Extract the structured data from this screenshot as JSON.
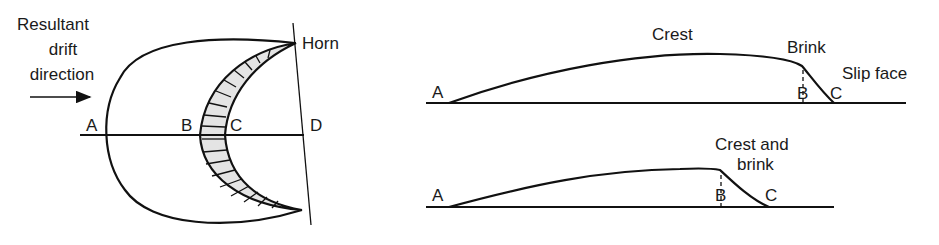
{
  "plan_view": {
    "drift_label_lines": [
      "Resultant",
      "drift",
      "direction"
    ],
    "points": {
      "A": "A",
      "B": "B",
      "C": "C",
      "D": "D"
    },
    "horn_label": "Horn"
  },
  "profile_top": {
    "crest_label": "Crest",
    "brink_label": "Brink",
    "slip_face_label": "Slip face",
    "points": {
      "A": "A",
      "B": "B",
      "C": "C"
    }
  },
  "profile_bottom": {
    "crest_brink_lines": [
      "Crest and",
      "brink"
    ],
    "points": {
      "A": "A",
      "B": "B",
      "C": "C"
    }
  },
  "colors": {
    "ink": "#111111",
    "slip_face_fill": "#e4e4e4",
    "background": "#ffffff"
  }
}
